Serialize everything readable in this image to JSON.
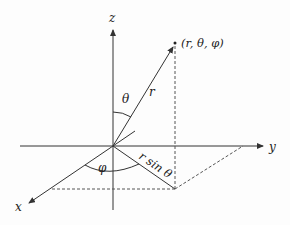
{
  "diagram": {
    "axes": {
      "x_label": "x",
      "y_label": "y",
      "z_label": "z"
    },
    "point_label": "(r, θ, φ)",
    "radius_label": "r",
    "theta_label": "θ",
    "phi_label": "φ",
    "projection_label": "r sin θ",
    "colors": {
      "line": "#333333",
      "dashed": "#555555",
      "background": "#fdfdfd"
    }
  }
}
